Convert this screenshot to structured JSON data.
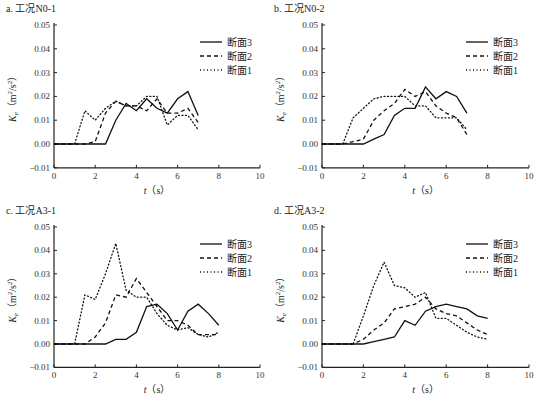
{
  "chart_data": [
    {
      "type": "line",
      "title": "a. 工况N0-1",
      "xlabel": "t（s）",
      "ylabel": "Ke（m²/s²）",
      "xlim": [
        0,
        10
      ],
      "ylim": [
        -0.01,
        0.05
      ],
      "xticks": [
        0,
        2,
        4,
        6,
        8,
        10
      ],
      "yticks": [
        "-0.01",
        "0.00",
        "0.01",
        "0.02",
        "0.03",
        "0.04",
        "0.05"
      ],
      "grid": false,
      "legend_position": "upper right",
      "series": [
        {
          "name": "断面3",
          "style": "solid",
          "x": [
            0,
            2.5,
            3,
            3.5,
            4,
            4.5,
            5,
            5.5,
            6,
            6.5,
            7
          ],
          "y": [
            0,
            0,
            0.01,
            0.017,
            0.014,
            0.019,
            0.015,
            0.013,
            0.019,
            0.022,
            0.012
          ]
        },
        {
          "name": "断面2",
          "style": "dashed",
          "x": [
            0,
            1.5,
            2,
            2.5,
            3,
            3.5,
            4,
            4.5,
            5,
            5.5,
            6,
            6.5,
            7
          ],
          "y": [
            0,
            0,
            0.001,
            0.013,
            0.018,
            0.016,
            0.016,
            0.014,
            0.019,
            0.013,
            0.013,
            0.015,
            0.009
          ]
        },
        {
          "name": "断面1",
          "style": "dotted",
          "x": [
            0,
            1,
            1.5,
            2,
            2.5,
            3,
            3.5,
            4,
            4.5,
            5,
            5.5,
            6,
            6.5,
            7
          ],
          "y": [
            0,
            0,
            0.014,
            0.01,
            0.015,
            0.018,
            0.016,
            0.016,
            0.02,
            0.02,
            0.008,
            0.012,
            0.012,
            0.006
          ]
        }
      ]
    },
    {
      "type": "line",
      "title": "b. 工况N0-2",
      "xlabel": "t（s）",
      "ylabel": "Ke（m²/s²）",
      "xlim": [
        0,
        10
      ],
      "ylim": [
        -0.01,
        0.05
      ],
      "xticks": [
        0,
        2,
        4,
        6,
        8,
        10
      ],
      "yticks": [
        "-0.01",
        "0.00",
        "0.01",
        "0.02",
        "0.03",
        "0.04",
        "0.05"
      ],
      "grid": false,
      "legend_position": "upper right",
      "series": [
        {
          "name": "断面3",
          "style": "solid",
          "x": [
            0,
            2,
            2.5,
            3,
            3.5,
            4,
            4.5,
            5,
            5.5,
            6,
            6.5,
            7
          ],
          "y": [
            0,
            0,
            0.002,
            0.004,
            0.012,
            0.015,
            0.015,
            0.024,
            0.019,
            0.022,
            0.02,
            0.013
          ]
        },
        {
          "name": "断面2",
          "style": "dashed",
          "x": [
            0,
            1,
            1.5,
            2,
            2.5,
            3,
            3.5,
            4,
            4.5,
            5,
            5.5,
            6,
            6.5,
            7
          ],
          "y": [
            0,
            0,
            0.001,
            0.002,
            0.01,
            0.014,
            0.017,
            0.023,
            0.02,
            0.022,
            0.016,
            0.013,
            0.011,
            0.004
          ]
        },
        {
          "name": "断面1",
          "style": "dotted",
          "x": [
            0,
            1,
            1.5,
            2,
            2.5,
            3,
            3.5,
            4,
            4.5,
            5,
            5.5,
            6,
            6.5,
            7
          ],
          "y": [
            0,
            0,
            0.011,
            0.015,
            0.019,
            0.02,
            0.02,
            0.02,
            0.016,
            0.016,
            0.011,
            0.011,
            0.011,
            0.006
          ]
        }
      ]
    },
    {
      "type": "line",
      "title": "c. 工况A3-1",
      "xlabel": "t（s）",
      "ylabel": "Ke（m²/s²）",
      "xlim": [
        0,
        10
      ],
      "ylim": [
        -0.01,
        0.05
      ],
      "xticks": [
        0,
        2,
        4,
        6,
        8,
        10
      ],
      "yticks": [
        "-0.01",
        "0.00",
        "0.01",
        "0.02",
        "0.03",
        "0.04",
        "0.05"
      ],
      "grid": false,
      "legend_position": "upper right",
      "series": [
        {
          "name": "断面3",
          "style": "solid",
          "x": [
            0,
            2.5,
            3,
            3.5,
            4,
            4.5,
            5,
            5.5,
            6,
            6.5,
            7,
            7.5,
            8
          ],
          "y": [
            0,
            0,
            0.002,
            0.002,
            0.005,
            0.016,
            0.017,
            0.013,
            0.006,
            0.014,
            0.017,
            0.013,
            0.008
          ]
        },
        {
          "name": "断面2",
          "style": "dashed",
          "x": [
            0,
            1.5,
            2,
            2.5,
            3,
            3.5,
            4,
            4.5,
            5,
            5.5,
            6,
            6.5,
            7,
            7.5,
            8
          ],
          "y": [
            0,
            0,
            0.003,
            0.009,
            0.021,
            0.02,
            0.028,
            0.022,
            0.016,
            0.01,
            0.01,
            0.008,
            0.004,
            0.004,
            0.004
          ]
        },
        {
          "name": "断面1",
          "style": "dotted",
          "x": [
            0,
            1,
            1.5,
            2,
            2.5,
            3,
            3.5,
            4,
            4.5,
            5,
            5.5,
            6,
            6.5,
            7,
            7.5,
            8
          ],
          "y": [
            0,
            0,
            0.021,
            0.019,
            0.03,
            0.043,
            0.023,
            0.02,
            0.02,
            0.013,
            0.008,
            0.006,
            0.007,
            0.004,
            0.003,
            0.005
          ]
        }
      ]
    },
    {
      "type": "line",
      "title": "d. 工况A3-2",
      "xlabel": "t（s）",
      "ylabel": "Ke（m²/s²）",
      "xlim": [
        0,
        10
      ],
      "ylim": [
        -0.01,
        0.05
      ],
      "xticks": [
        0,
        2,
        4,
        6,
        8,
        10
      ],
      "yticks": [
        "-0.01",
        "0.00",
        "0.01",
        "0.02",
        "0.03",
        "0.04",
        "0.05"
      ],
      "grid": false,
      "legend_position": "upper right",
      "series": [
        {
          "name": "断面3",
          "style": "solid",
          "x": [
            0,
            2,
            2.5,
            3,
            3.5,
            4,
            4.5,
            5,
            5.5,
            6,
            6.5,
            7,
            7.5,
            8
          ],
          "y": [
            0,
            0,
            0.001,
            0.002,
            0.003,
            0.01,
            0.008,
            0.014,
            0.016,
            0.017,
            0.016,
            0.015,
            0.012,
            0.011
          ]
        },
        {
          "name": "断面2",
          "style": "dashed",
          "x": [
            0,
            1.5,
            2,
            2.5,
            3,
            3.5,
            4,
            4.5,
            5,
            5.5,
            6,
            6.5,
            7,
            7.5,
            8
          ],
          "y": [
            0,
            0,
            0.002,
            0.006,
            0.009,
            0.015,
            0.016,
            0.017,
            0.02,
            0.015,
            0.013,
            0.012,
            0.009,
            0.006,
            0.004
          ]
        },
        {
          "name": "断面1",
          "style": "dotted",
          "x": [
            0,
            1.5,
            2,
            2.5,
            3,
            3.5,
            4,
            4.5,
            5,
            5.5,
            6,
            6.5,
            7,
            7.5,
            8
          ],
          "y": [
            0,
            0,
            0.012,
            0.025,
            0.035,
            0.025,
            0.024,
            0.02,
            0.022,
            0.011,
            0.011,
            0.008,
            0.005,
            0.003,
            0.002
          ]
        }
      ]
    }
  ]
}
